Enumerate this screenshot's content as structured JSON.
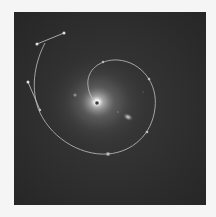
{
  "image": {
    "alt": "Galaxy photograph with a spiral bezier path overlay",
    "background_color": "#f5f5f5",
    "frame_color": "#2b2b2b",
    "core_glow_color": "#ffffff",
    "path_color": "#c8c8c8",
    "anchor_color": "#d8d8d8"
  }
}
